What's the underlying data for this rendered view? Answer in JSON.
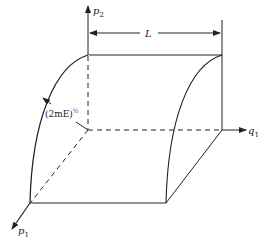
{
  "diagram": {
    "type": "phase-space-region",
    "axes": {
      "vertical": {
        "label": "p",
        "subscript": "2"
      },
      "horizontal": {
        "label": "q",
        "subscript": "1"
      },
      "depth": {
        "label": "p",
        "subscript": "1"
      }
    },
    "dimension": {
      "label": "L"
    },
    "radius": {
      "label_main": "(2mE)",
      "label_exp": "½"
    },
    "colors": {
      "line": "#222222",
      "background": "#ffffff"
    }
  }
}
